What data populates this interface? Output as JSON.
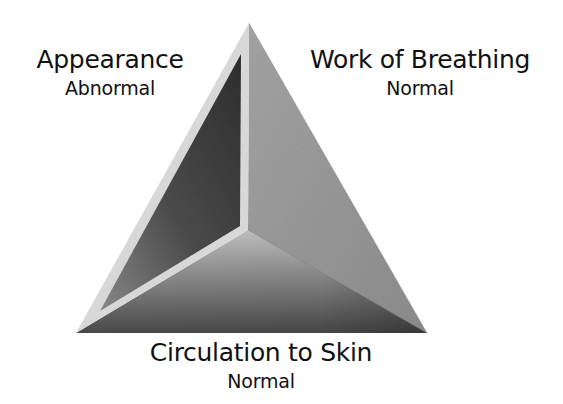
{
  "diagram": {
    "components": [
      {
        "id": "appearance",
        "label": "Appearance",
        "status": "Abnormal",
        "highlighted": true
      },
      {
        "id": "breathing",
        "label": "Work of Breathing",
        "status": "Normal",
        "highlighted": false
      },
      {
        "id": "circulation",
        "label": "Circulation to Skin",
        "status": "Normal",
        "highlighted": false
      }
    ],
    "colors": {
      "background": "#ffffff",
      "text": "#111111",
      "highlight_border": "#dcdcdc",
      "left_face_dark": "#2e2e2e",
      "left_face_mid": "#7a7a7a",
      "right_face": "#969696",
      "bottom_face_light": "#c4c4c4",
      "bottom_face_dark": "#4a4a4a"
    },
    "geometry": {
      "apex": [
        249,
        23
      ],
      "bottom_left": [
        76,
        333
      ],
      "bottom_right": [
        427,
        333
      ],
      "center": [
        248,
        230
      ]
    }
  }
}
